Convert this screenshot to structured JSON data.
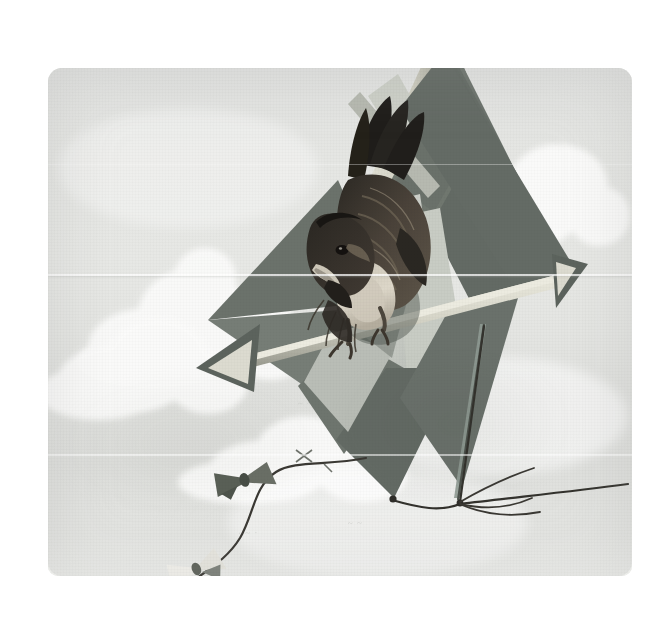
{
  "artwork": {
    "title": "Bird Perched on a Kite",
    "medium": "vintage colour-plate illustration",
    "caption": "",
    "orientation": "square"
  },
  "canvas": {
    "width": 671,
    "height": 618,
    "page_background": "#ffffff",
    "plate": {
      "x": 48,
      "y": 68,
      "width": 584,
      "height": 508,
      "corner_radius": 14
    }
  },
  "palette": {
    "sky_light": "#e7e8e5",
    "sky_mid": "#e0e1de",
    "sky_shadow": "#d3d5d0",
    "cloud_white": "#fbfbfa",
    "kite_sail_dark": "#5f6660",
    "kite_sail_mid": "#6e756e",
    "kite_sail_light": "#8a908a",
    "kite_sail_pale": "#c9cdc6",
    "kite_spar_cream": "#d9d8cb",
    "kite_spar_shadow": "#9a9a8e",
    "bird_black": "#23211f",
    "bird_brown": "#4a443d",
    "bird_tan": "#8e8madd",
    "bird_cream": "#ddd8cc",
    "string_dark": "#3a3833",
    "ribbon_dark": "#555a52",
    "ribbon_light": "#f2f1ec",
    "pencil_mark": "#b9bcb7"
  },
  "scene": {
    "subject": "songbird",
    "object": "diamond box kite",
    "background": "cumulus clouds in pale sky",
    "elements": [
      {
        "name": "kite",
        "description": "large diamond kite with dark sail panels, pale wooden spars and an arrow-shaped crossbar"
      },
      {
        "name": "bird",
        "description": "dark songbird gripping the kite crossbar, head turned down, tail raised"
      },
      {
        "name": "kite-tail",
        "description": "curving string tail with two bow ribbons, one dark and one white"
      },
      {
        "name": "flying-line",
        "description": "taut tether line running to the lower right edge"
      },
      {
        "name": "clouds",
        "description": "banks of cumulus cloud at left, lower centre and upper right"
      }
    ]
  },
  "kite": {
    "sail_color": "#6e756e",
    "spar_color": "#d9d8cb",
    "panels": 6,
    "has_bridle": true,
    "tail_bows": 2,
    "tail_bow_colors": [
      "#555a52",
      "#f2f1ec"
    ]
  },
  "bird": {
    "plumage_primary": "#23211f",
    "plumage_secondary": "#5c544a",
    "breast": "#d8d2c4",
    "beak": "#cdc7b8",
    "pose": "perched, leaning forward"
  },
  "clouds": [
    {
      "name": "left-bank",
      "x": 52,
      "y": 178,
      "w": 200,
      "h": 120
    },
    {
      "name": "left-lower-bank",
      "x": 20,
      "y": 240,
      "w": 180,
      "h": 110
    },
    {
      "name": "centre-low-bank",
      "x": 150,
      "y": 348,
      "w": 200,
      "h": 100
    },
    {
      "name": "upper-right-bank",
      "x": 410,
      "y": 78,
      "w": 150,
      "h": 100
    },
    {
      "name": "mid-right-haze",
      "x": 300,
      "y": 300,
      "w": 260,
      "h": 110
    }
  ],
  "pencil_marks": [
    {
      "text": "~ ~ ~ ~",
      "x": 250,
      "y": 330
    },
    {
      "text": "~ ~ ~",
      "x": 390,
      "y": 300
    },
    {
      "text": "· ~ ·",
      "x": 190,
      "y": 460
    },
    {
      "text": "~ ~",
      "x": 300,
      "y": 450
    }
  ]
}
